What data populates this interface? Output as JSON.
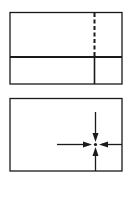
{
  "diagram": {
    "stroke_color": "#1a1a1a",
    "background": "#ffffff",
    "panels": [
      {
        "name": "top-panel",
        "description": "Rectangle divided by a thick horizontal line with a vertical line that is dashed above and solid below"
      },
      {
        "name": "bottom-panel",
        "description": "Rectangle with four arrows converging on a center point"
      }
    ]
  }
}
